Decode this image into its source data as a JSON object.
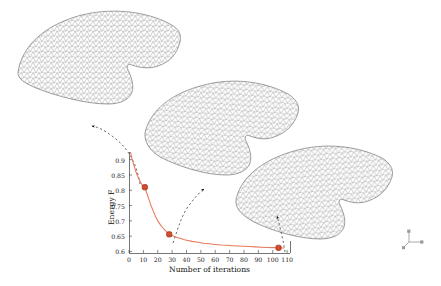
{
  "figure": {
    "name": "energy-minimization-convergence",
    "background": "#ffffff",
    "width": 441,
    "height": 286
  },
  "chart_data": {
    "type": "line",
    "title": "",
    "xlabel": "Number of iterations",
    "ylabel": "Energy F",
    "xlim": [
      0,
      112
    ],
    "ylim": [
      0.595,
      0.925
    ],
    "grid": false,
    "legend": "none",
    "line_color": "#e8795c",
    "marker_color": "#d94a2b",
    "marker_edge": "#8f2d18",
    "xticks": [
      0,
      10,
      20,
      30,
      40,
      50,
      60,
      70,
      80,
      90,
      100,
      110
    ],
    "xticklabels": [
      "0",
      "10",
      "20",
      "30",
      "40",
      "50",
      "60",
      "70",
      "80",
      "90",
      "100",
      "110"
    ],
    "yticks": [
      0.6,
      0.65,
      0.7,
      0.75,
      0.8,
      0.85,
      0.9
    ],
    "yticklabels": [
      "0.6",
      "0.65",
      "0.7",
      "0.75",
      "0.8",
      "0.85",
      "0.9"
    ],
    "x": [
      1,
      2,
      3,
      4,
      5,
      6,
      7,
      8,
      9,
      10,
      11,
      12,
      13,
      14,
      15,
      16,
      17,
      18,
      19,
      20,
      22,
      24,
      26,
      28,
      30,
      32,
      34,
      36,
      38,
      40,
      44,
      48,
      52,
      56,
      60,
      64,
      68,
      72,
      76,
      80,
      84,
      88,
      92,
      96,
      100,
      104,
      108
    ],
    "y": [
      0.925,
      0.905,
      0.888,
      0.872,
      0.858,
      0.846,
      0.836,
      0.827,
      0.818,
      0.813,
      0.81,
      0.796,
      0.782,
      0.768,
      0.754,
      0.742,
      0.73,
      0.719,
      0.709,
      0.7,
      0.686,
      0.675,
      0.665,
      0.656,
      0.652,
      0.648,
      0.645,
      0.642,
      0.639,
      0.637,
      0.633,
      0.63,
      0.627,
      0.625,
      0.623,
      0.621,
      0.62,
      0.619,
      0.618,
      0.617,
      0.616,
      0.615,
      0.614,
      0.613,
      0.6125,
      0.612,
      0.6115
    ],
    "highlighted_points": [
      {
        "label": "iteration-11",
        "x": 11,
        "y": 0.81
      },
      {
        "label": "iteration-28",
        "x": 28,
        "y": 0.656
      },
      {
        "label": "iteration-104",
        "x": 104,
        "y": 0.612
      }
    ],
    "annotations": [
      {
        "name": "arrow-to-mesh-initial",
        "from_point": 0,
        "to_mesh": "mesh-initial"
      },
      {
        "name": "arrow-to-mesh-intermediate",
        "from_point": 1,
        "to_mesh": "mesh-intermediate"
      },
      {
        "name": "arrow-to-mesh-converged",
        "from_point": 2,
        "to_mesh": "mesh-converged"
      }
    ]
  },
  "meshes": [
    {
      "name": "mesh-initial",
      "position": "top-left",
      "style": "triangulated-wireframe",
      "color": "#6e6e6e"
    },
    {
      "name": "mesh-intermediate",
      "position": "middle-center",
      "style": "triangulated-wireframe",
      "color": "#6e6e6e"
    },
    {
      "name": "mesh-converged",
      "position": "bottom-right",
      "style": "triangulated-wireframe",
      "color": "#6e6e6e"
    }
  ],
  "axis_triad": {
    "name": "orientation-axis-triad",
    "position": "bottom-right",
    "color": "#8a8a8a"
  }
}
